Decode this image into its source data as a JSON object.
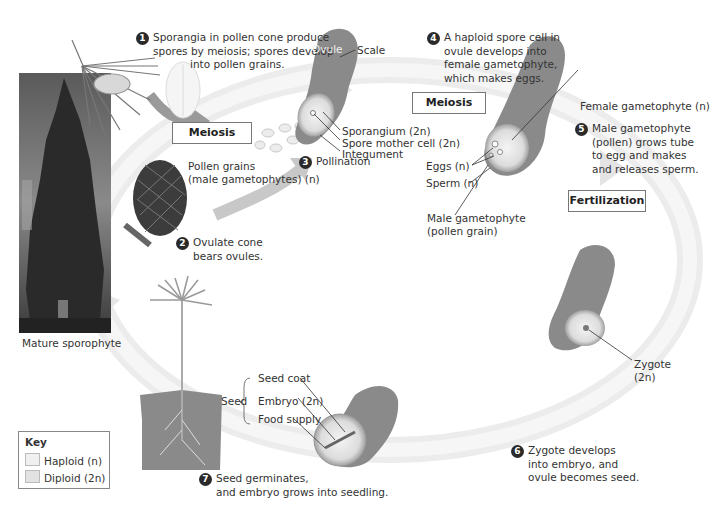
{
  "colors": {
    "haploid": "#f0f0f0",
    "diploid": "#e2e2e2",
    "cycle_arrow": "#e6e6e6",
    "ovule_body": "#8a8a8a"
  },
  "steps": [
    {
      "number": "1",
      "text": [
        "Sporangia in pollen cone produce",
        "spores by meiosis;  spores develop",
        "into pollen grains."
      ]
    },
    {
      "number": "2",
      "text": [
        "Ovulate cone",
        "bears ovules."
      ]
    },
    {
      "number": "3",
      "text": [
        "Pollination"
      ]
    },
    {
      "number": "4",
      "text": [
        "A haploid spore cell in",
        "ovule develops into",
        "female gametophyte,",
        "which makes eggs."
      ]
    },
    {
      "number": "5",
      "text": [
        "Male gametophyte",
        "(pollen) grows tube",
        "to egg and makes",
        "and releases sperm."
      ]
    },
    {
      "number": "6",
      "text": [
        "Zygote develops",
        "into embryo, and",
        "ovule becomes seed."
      ]
    },
    {
      "number": "7",
      "text": [
        "Seed germinates,",
        "and embryo grows into seedling."
      ]
    }
  ],
  "process_boxes": {
    "meiosis_1": "Meiosis",
    "meiosis_2": "Meiosis",
    "fertilization": "Fertilization"
  },
  "labels": {
    "ovule": "Ovule",
    "scale": "Scale",
    "sporangium": "Sporangium (2n)",
    "spore_mother_cell": "Spore mother cell (2n)",
    "integument": "Integument",
    "pollen_grains_1": "Pollen grains",
    "pollen_grains_2": "(male gametophytes) (n)",
    "female_gametophyte": "Female gametophyte (n)",
    "eggs": "Eggs (n)",
    "sperm": "Sperm (n)",
    "male_gametophyte_1": "Male gametophyte",
    "male_gametophyte_2": "(pollen grain)",
    "zygote_1": "Zygote",
    "zygote_2": "(2n)",
    "seed": "Seed",
    "seed_coat": "Seed coat",
    "embryo": "Embryo (2n)",
    "food_supply": "Food  supply",
    "mature_sporophyte": "Mature sporophyte"
  },
  "key": {
    "title": "Key",
    "items": [
      {
        "label": "Haploid (n)",
        "type": "haploid"
      },
      {
        "label": "Diploid (2n)",
        "type": "diploid"
      }
    ]
  }
}
